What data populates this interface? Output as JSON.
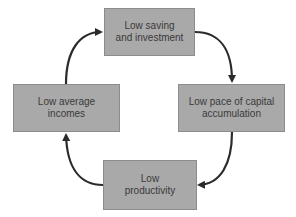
{
  "diagram": {
    "type": "cycle",
    "nodes": [
      {
        "id": "top",
        "label": "Low saving\nand investment"
      },
      {
        "id": "right",
        "label": "Low pace of capital\naccumulation"
      },
      {
        "id": "bottom",
        "label": "Low\nproductivity"
      },
      {
        "id": "left",
        "label": "Low average\nincomes"
      }
    ],
    "edges": [
      {
        "from": "top",
        "to": "right"
      },
      {
        "from": "right",
        "to": "bottom"
      },
      {
        "from": "bottom",
        "to": "left"
      },
      {
        "from": "left",
        "to": "top"
      }
    ],
    "colors": {
      "box_fill": "#a9a9a9",
      "box_border": "#8c8c8c",
      "text": "#3a3a3a",
      "arrow": "#2b2b2b"
    }
  }
}
